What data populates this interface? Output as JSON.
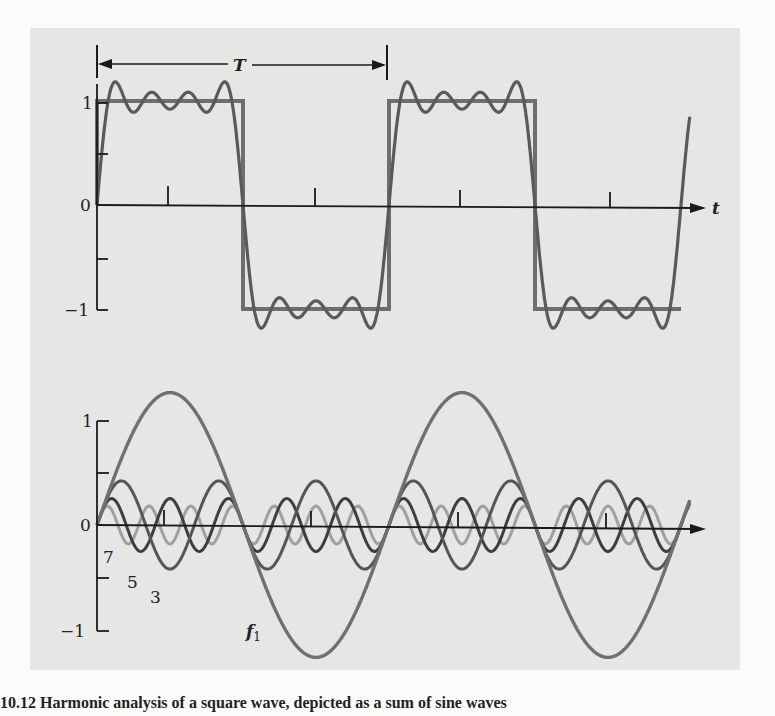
{
  "figure": {
    "caption_fragment": "10.12  Harmonic analysis of a square wave, depicted as a sum of sine waves",
    "background_color": "#e6e6e4",
    "line_colors": {
      "square": "#6e6e6e",
      "axes": "#1a1a1a",
      "fundamental": "#707070",
      "h3": "#555555",
      "h5": "#3e3e3e",
      "h7": "#9a9a9a"
    }
  },
  "chart_data": [
    {
      "type": "line",
      "title": "Square wave and its Fourier (4-term) approximation",
      "xlabel": "t",
      "ylabel": "",
      "period_label": "T",
      "yticks": [
        "1",
        "0",
        "−1"
      ],
      "ylim": [
        -1,
        1
      ],
      "xrange_periods": [
        0,
        2.05
      ],
      "series": [
        {
          "name": "square wave",
          "x": [
            0,
            0.5,
            0.5,
            1.0,
            1.0,
            1.5,
            1.5,
            2.0
          ],
          "values": [
            1,
            1,
            -1,
            -1,
            1,
            1,
            -1,
            -1
          ]
        },
        {
          "name": "sum f1+f3+f5+f7",
          "formula": "(4/π)·Σ sin(2π n t/T)/n, n=1,3,5,7"
        }
      ],
      "grid": false
    },
    {
      "type": "line",
      "title": "Harmonic components",
      "xlabel": "t",
      "yticks": [
        "1",
        "0",
        "−1"
      ],
      "ylim": [
        -1,
        1
      ],
      "series": [
        {
          "name": "f1",
          "harmonic": 1,
          "amplitude": 1.27
        },
        {
          "name": "3",
          "harmonic": 3,
          "amplitude": 0.42
        },
        {
          "name": "5",
          "harmonic": 5,
          "amplitude": 0.25
        },
        {
          "name": "7",
          "harmonic": 7,
          "amplitude": 0.18
        }
      ],
      "series_labels": [
        "7",
        "5",
        "3",
        "f₁"
      ],
      "grid": false
    }
  ],
  "labels": {
    "period": "T",
    "t_axis": "t",
    "top_y1": "1",
    "top_y0": "0",
    "top_ym1": "−1",
    "bot_y1": "1",
    "bot_y0": "0",
    "bot_ym1": "−1",
    "h7": "7",
    "h5": "5",
    "h3": "3",
    "f1_main": "f",
    "f1_sub": "1"
  }
}
